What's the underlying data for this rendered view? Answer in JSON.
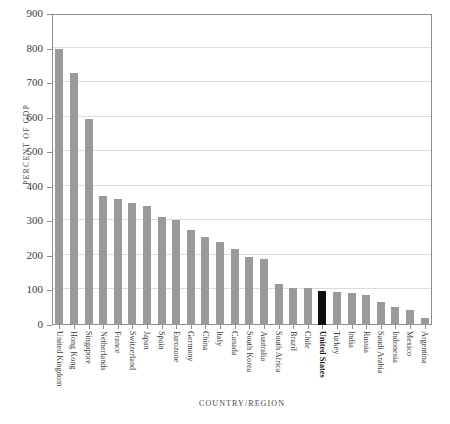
{
  "chart_data": {
    "type": "bar",
    "title": "",
    "xlabel": "COUNTRY/REGION",
    "ylabel": "PERCENT OF GDP",
    "ylim": [
      0,
      900
    ],
    "yticks": [
      0,
      100,
      200,
      300,
      400,
      500,
      600,
      700,
      800,
      900
    ],
    "grid": true,
    "legend": "none",
    "bar_color": "#9a9a9a",
    "highlight_color": "#0d0d0d",
    "highlight_category": "United States",
    "categories": [
      "United Kingdom",
      "Hong Kong",
      "Singapore",
      "Netherlands",
      "France",
      "Switzerland",
      "Japan",
      "Spain",
      "Eurozone",
      "Germany",
      "China",
      "Italy",
      "Canada",
      "South Korea",
      "Australia",
      "South Africa",
      "Brazil",
      "Chile",
      "United States",
      "Turkey",
      "India",
      "Russia",
      "Saudi Arabia",
      "Indonesia",
      "Mexico",
      "Argentina"
    ],
    "values": [
      800,
      730,
      597,
      372,
      366,
      352,
      343,
      313,
      303,
      275,
      256,
      240,
      220,
      196,
      190,
      119,
      108,
      108,
      99,
      96,
      94,
      87,
      68,
      53,
      44,
      20
    ]
  },
  "axis": {
    "y_title": "PERCENT OF GDP",
    "x_title": "COUNTRY/REGION"
  }
}
